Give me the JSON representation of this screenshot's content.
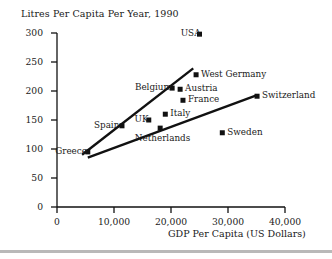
{
  "chart_data": {
    "type": "scatter",
    "title": "Litres Per Capita Per Year, 1990",
    "xlabel": "GDP Per Capita (US Dollars)",
    "ylabel": "",
    "xlim": [
      0,
      40000
    ],
    "ylim": [
      0,
      300
    ],
    "grid": false,
    "legend": "none",
    "xticks": [
      "0",
      "10,000",
      "20,000",
      "30,000",
      "40,000"
    ],
    "xtick_values": [
      0,
      10000,
      20000,
      30000,
      40000
    ],
    "yticks": [
      "0",
      "50",
      "100",
      "150",
      "200",
      "250",
      "300"
    ],
    "ytick_values": [
      0,
      50,
      100,
      150,
      200,
      250,
      300
    ],
    "points": [
      {
        "name": "USA",
        "x": 25000,
        "y": 298,
        "label_side": "left"
      },
      {
        "name": "West Germany",
        "x": 24400,
        "y": 228,
        "label_side": "right"
      },
      {
        "name": "Belgium",
        "x": 20200,
        "y": 205,
        "label_side": "left"
      },
      {
        "name": "Austria",
        "x": 21600,
        "y": 203,
        "label_side": "right"
      },
      {
        "name": "France",
        "x": 22100,
        "y": 184,
        "label_side": "right"
      },
      {
        "name": "Switzerland",
        "x": 35100,
        "y": 191,
        "label_side": "right"
      },
      {
        "name": "Italy",
        "x": 19000,
        "y": 160,
        "label_side": "right"
      },
      {
        "name": "UK",
        "x": 16100,
        "y": 150,
        "label_side": "left"
      },
      {
        "name": "Spain",
        "x": 11400,
        "y": 140,
        "label_side": "left"
      },
      {
        "name": "Netherlands",
        "x": 18100,
        "y": 136,
        "label_side": "below"
      },
      {
        "name": "Sweden",
        "x": 29000,
        "y": 128,
        "label_side": "right"
      },
      {
        "name": "Greece",
        "x": 5400,
        "y": 95,
        "label_side": "left"
      }
    ],
    "trend_lines": [
      {
        "name": "upper-trend-line",
        "x0": 4400,
        "y0": 90,
        "x1": 23900,
        "y1": 239
      },
      {
        "name": "lower-trend-line",
        "x0": 5400,
        "y0": 85,
        "x1": 35100,
        "y1": 193
      }
    ],
    "marker_color": "#111111",
    "line_color": "#111111",
    "axis_color": "#111111"
  }
}
